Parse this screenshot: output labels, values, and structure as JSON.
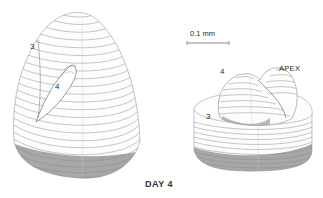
{
  "figure": {
    "caption": "DAY 4",
    "scale_bar": {
      "label": "0.1 mm"
    },
    "left_specimen": {
      "labels": {
        "outer": "3",
        "inner": "4"
      }
    },
    "right_specimen": {
      "labels": {
        "outer": "3",
        "inner": "4",
        "apex": "APEX"
      }
    },
    "colors": {
      "background": "#ffffff",
      "line": "#555555",
      "shade": "#7a7a7a",
      "text": "#2a2a2a"
    }
  }
}
